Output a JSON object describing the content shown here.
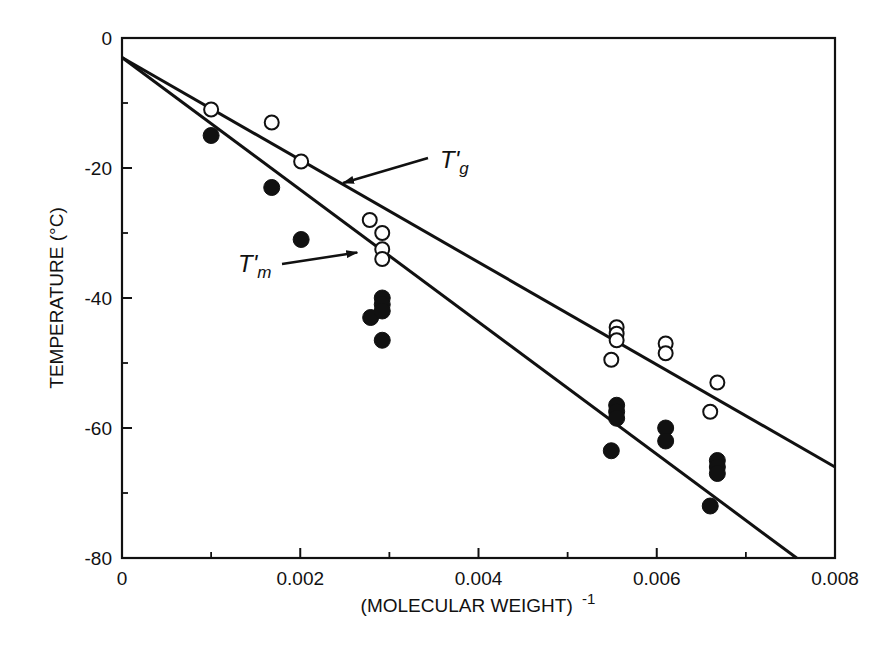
{
  "chart_data": {
    "type": "scatter",
    "title": "",
    "xlabel": "(MOLECULAR WEIGHT)",
    "xlabel_superscript": "-1",
    "ylabel": "TEMPERATURE (°C)",
    "xlim": [
      0,
      0.008
    ],
    "ylim": [
      -80,
      0
    ],
    "x_ticks": [
      0,
      0.002,
      0.004,
      0.006,
      0.008
    ],
    "x_tick_labels": [
      "0",
      "0.002",
      "0.004",
      "0.006",
      "0.008"
    ],
    "x_minor_ticks": [
      0.001,
      0.003,
      0.005,
      0.007
    ],
    "y_ticks": [
      0,
      -20,
      -40,
      -60,
      -80
    ],
    "y_tick_labels": [
      "0",
      "-20",
      "-40",
      "-60",
      "-80"
    ],
    "y_minor_ticks": [
      -10,
      -30,
      -50,
      -70
    ],
    "grid": false,
    "legend": null,
    "series": [
      {
        "name": "T'g",
        "marker": "open-circle",
        "points": [
          [
            0.001,
            -11
          ],
          [
            0.00168,
            -13
          ],
          [
            0.00201,
            -19
          ],
          [
            0.00278,
            -28
          ],
          [
            0.00292,
            -30
          ],
          [
            0.00292,
            -32.5
          ],
          [
            0.00292,
            -34
          ],
          [
            0.00549,
            -49.5
          ],
          [
            0.00555,
            -44.5
          ],
          [
            0.00555,
            -45.5
          ],
          [
            0.00555,
            -46.5
          ],
          [
            0.0061,
            -47
          ],
          [
            0.0061,
            -48.5
          ],
          [
            0.0066,
            -57.5
          ],
          [
            0.00668,
            -53
          ]
        ],
        "fit_line": {
          "x0": 0,
          "y0": -3,
          "x1": 0.008,
          "y1": -66
        }
      },
      {
        "name": "T'm",
        "marker": "filled-circle",
        "points": [
          [
            0.001,
            -15
          ],
          [
            0.00168,
            -23
          ],
          [
            0.00201,
            -31
          ],
          [
            0.00279,
            -43
          ],
          [
            0.00292,
            -40
          ],
          [
            0.00292,
            -41
          ],
          [
            0.00292,
            -42
          ],
          [
            0.00292,
            -46.5
          ],
          [
            0.00549,
            -63.5
          ],
          [
            0.00555,
            -56.5
          ],
          [
            0.00555,
            -57.5
          ],
          [
            0.00555,
            -58.5
          ],
          [
            0.0061,
            -60
          ],
          [
            0.0061,
            -62
          ],
          [
            0.0066,
            -72
          ],
          [
            0.00668,
            -65
          ],
          [
            0.00668,
            -66
          ],
          [
            0.00668,
            -67
          ]
        ],
        "fit_line": {
          "x0": 0,
          "y0": -3,
          "x1": 0.00757,
          "y1": -80
        }
      }
    ],
    "annotations": [
      {
        "text_main": "T'",
        "text_sub": "g",
        "label": "T'g",
        "arrow_to": [
          0.00248,
          -22.3
        ]
      },
      {
        "text_main": "T'",
        "text_sub": "m",
        "label": "T'm",
        "arrow_to": [
          0.00264,
          -33.0
        ]
      }
    ]
  }
}
